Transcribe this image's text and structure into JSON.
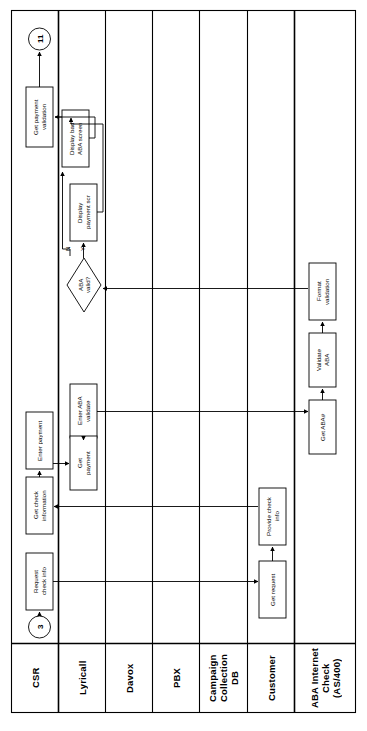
{
  "diagram": {
    "orientation": "rotated-90-ccw",
    "frame": {
      "stroke": "#000000",
      "fill": "#ffffff"
    },
    "lanes": [
      {
        "id": "csr",
        "label": "CSR"
      },
      {
        "id": "lyricall",
        "label": "Lyricall"
      },
      {
        "id": "davox",
        "label": "Davox"
      },
      {
        "id": "pbx",
        "label": "PBX"
      },
      {
        "id": "campaign",
        "label": "Campaign\nCollection\nDB"
      },
      {
        "id": "customer",
        "label": "Customer"
      },
      {
        "id": "aba",
        "label": "ABA Internet\nCheck\n(AS/400)"
      }
    ],
    "connectors": [
      {
        "id": "conn-11",
        "label": "11",
        "shape": "circle"
      },
      {
        "id": "conn-3",
        "label": "3",
        "shape": "circle"
      }
    ],
    "nodes": [
      {
        "id": "get-payment-validation",
        "lane": "csr",
        "shape": "process",
        "label": "Get payment\nvalidation"
      },
      {
        "id": "enter-payment",
        "lane": "csr",
        "shape": "process",
        "label": "Enter payment"
      },
      {
        "id": "get-check-information",
        "lane": "csr",
        "shape": "process",
        "label": "Get check\ninformation"
      },
      {
        "id": "request-check-info",
        "lane": "csr",
        "shape": "process",
        "label": "Request\ncheck info"
      },
      {
        "id": "display-bad-aba-screen",
        "lane": "lyricall",
        "shape": "process",
        "label": "Display bad\nABA screen"
      },
      {
        "id": "display-payment-scr",
        "lane": "lyricall",
        "shape": "process",
        "label": "Display\npayment scr"
      },
      {
        "id": "aba-valid",
        "lane": "lyricall",
        "shape": "decision",
        "label": "ABA\nvalid?"
      },
      {
        "id": "enter-aba-validate",
        "lane": "lyricall",
        "shape": "process",
        "label": "Enter ABA\nvalidate"
      },
      {
        "id": "get-payment",
        "lane": "lyricall",
        "shape": "process",
        "label": "Get\npayment"
      },
      {
        "id": "provide-check-info",
        "lane": "customer",
        "shape": "process",
        "label": "Provide check\ninfo"
      },
      {
        "id": "get-request",
        "lane": "customer",
        "shape": "process",
        "label": "Get request"
      },
      {
        "id": "format-validation",
        "lane": "aba",
        "shape": "process",
        "label": "Format\nvalidation"
      },
      {
        "id": "validate-aba",
        "lane": "aba",
        "shape": "process",
        "label": "Validate\nABA"
      },
      {
        "id": "get-aba-number",
        "lane": "aba",
        "shape": "process",
        "label": "Get ABA#"
      }
    ],
    "edge_labels": [
      {
        "id": "branch-no",
        "label": "N"
      },
      {
        "id": "branch-yes",
        "label": "Y"
      }
    ]
  }
}
